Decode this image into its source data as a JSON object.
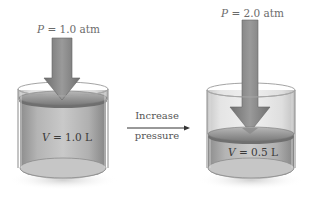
{
  "diagram": {
    "left_state": {
      "pressure_symbol": "P",
      "pressure_value": " = 1.0 atm",
      "volume_symbol": "V",
      "volume_value": " = 1.0 L"
    },
    "transition": {
      "line1": "Increase",
      "line2": "pressure"
    },
    "right_state": {
      "pressure_symbol": "P",
      "pressure_value": " = 2.0 atm",
      "volume_symbol": "V",
      "volume_value": " = 0.5 L"
    },
    "colors": {
      "cylinder_glass": "#c8c8c8",
      "gas_fill": "#a9a9a9",
      "arrow": "#8a8a8a",
      "piston": "#9a9a9a",
      "text": "#666666"
    }
  }
}
